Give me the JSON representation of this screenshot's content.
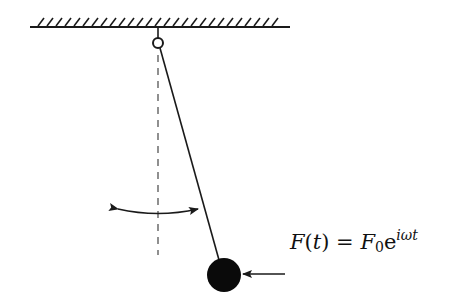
{
  "diagram": {
    "elements": {
      "ceiling": {
        "x1": 30,
        "x2": 290,
        "y": 27,
        "hatch_top": 17
      },
      "pivot": {
        "cx": 158,
        "cy": 43,
        "r": 5
      },
      "rod": {
        "x1": 160,
        "y1": 48,
        "x2": 218,
        "y2": 259
      },
      "equilibrium_line": {
        "x": 158,
        "y1": 55,
        "y2": 255
      },
      "swing_arrow": {
        "x1": 118,
        "y1": 209,
        "x2": 198,
        "y2": 209,
        "sag": 6
      },
      "bob": {
        "cx": 224,
        "cy": 275,
        "r": 17,
        "color": "#0a0a0a"
      },
      "force_arrow": {
        "x1": 285,
        "y1": 274,
        "x2": 242,
        "y2": 274
      }
    },
    "formula": {
      "F": "F",
      "t_open": "(",
      "t": "t",
      "t_close": ")",
      "equals": " = ",
      "F0": "F",
      "sub0": "0",
      "e": "e",
      "exponent": "iωt"
    },
    "colors": {
      "line": "#1a1a1a",
      "dash": "#555555",
      "background": "#ffffff"
    }
  }
}
